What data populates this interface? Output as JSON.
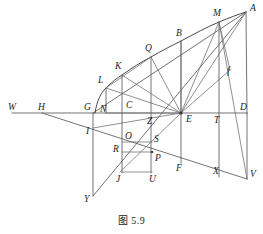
{
  "figure": {
    "caption": "图 5.9",
    "background_color": "#ffffff",
    "line_color": "#5a5a5a",
    "curve_color": "#4a4a4a",
    "label_color": "#1b1b1b",
    "width": 263,
    "height": 234
  },
  "points": [
    {
      "id": "W",
      "label": "W",
      "x": 12,
      "y": 113,
      "label_x": 12,
      "label_y": 108,
      "role": "axis-endpoint-left"
    },
    {
      "id": "H",
      "label": "H",
      "x": 42,
      "y": 113,
      "label_x": 42,
      "label_y": 108,
      "role": "axis-point"
    },
    {
      "id": "G",
      "label": "G",
      "x": 93,
      "y": 113,
      "label_x": 89,
      "label_y": 108,
      "role": "axis-point"
    },
    {
      "id": "N",
      "label": "N",
      "x": 105,
      "y": 113,
      "label_x": 104,
      "label_y": 109,
      "role": "foot-of-L"
    },
    {
      "id": "C",
      "label": "C",
      "x": 131,
      "y": 113,
      "label_x": 129,
      "label_y": 107,
      "role": "axis-point"
    },
    {
      "id": "Z",
      "label": "Z",
      "x": 152,
      "y": 113,
      "label_x": 151,
      "label_y": 121,
      "role": "axis-point"
    },
    {
      "id": "E",
      "label": "E",
      "x": 181,
      "y": 113,
      "label_x": 186,
      "label_y": 120,
      "role": "pencil-vertex"
    },
    {
      "id": "T",
      "label": "T",
      "x": 219,
      "y": 113,
      "label_x": 218,
      "label_y": 120,
      "role": "axis-point"
    },
    {
      "id": "D",
      "label": "D",
      "x": 247,
      "y": 113,
      "label_x": 245,
      "label_y": 108,
      "role": "axis-endpoint-right"
    },
    {
      "id": "A",
      "label": "A",
      "x": 246,
      "y": 12,
      "label_x": 249,
      "label_y": 8,
      "role": "curve-endpoint-top"
    },
    {
      "id": "M",
      "label": "M",
      "x": 219,
      "y": 22,
      "label_x": 216,
      "label_y": 14,
      "role": "curve-point"
    },
    {
      "id": "B",
      "label": "B",
      "x": 181,
      "y": 41,
      "label_x": 179,
      "label_y": 34,
      "role": "curve-point"
    },
    {
      "id": "Q",
      "label": "Q",
      "x": 150,
      "y": 57,
      "label_x": 148,
      "label_y": 49,
      "role": "curve-point"
    },
    {
      "id": "K",
      "label": "K",
      "x": 122,
      "y": 75,
      "label_x": 119,
      "label_y": 67,
      "role": "curve-point"
    },
    {
      "id": "L",
      "label": "L",
      "x": 106,
      "y": 88,
      "label_x": 101,
      "label_y": 81,
      "role": "curve-point"
    },
    {
      "id": "I",
      "label": "I",
      "x": 93,
      "y": 128,
      "label_x": 88,
      "label_y": 131,
      "role": "lower-line-point"
    },
    {
      "id": "O",
      "label": "O",
      "x": 131,
      "y": 142,
      "label_x": 128,
      "label_y": 137,
      "role": "lower-point"
    },
    {
      "id": "S",
      "label": "S",
      "x": 152,
      "y": 142,
      "label_x": 151,
      "label_y": 140,
      "role": "lower-point"
    },
    {
      "id": "R",
      "label": "R",
      "x": 120,
      "y": 152,
      "label_x": 116,
      "label_y": 149,
      "role": "lower-point"
    },
    {
      "id": "P",
      "label": "P",
      "x": 152,
      "y": 155,
      "label_x": 153,
      "label_y": 158,
      "role": "lower-point"
    },
    {
      "id": "J",
      "label": "J",
      "x": 120,
      "y": 172,
      "label_x": 118,
      "label_y": 177,
      "role": "lower-point"
    },
    {
      "id": "U",
      "label": "U",
      "x": 152,
      "y": 172,
      "label_x": 153,
      "label_y": 177,
      "role": "lower-point"
    },
    {
      "id": "F",
      "label": "F",
      "x": 181,
      "y": 163,
      "label_x": 179,
      "label_y": 169,
      "role": "lower-point"
    },
    {
      "id": "X",
      "label": "X",
      "x": 219,
      "y": 177,
      "label_x": 217,
      "label_y": 172,
      "role": "lower-point"
    },
    {
      "id": "V",
      "label": "V",
      "x": 247,
      "y": 179,
      "label_x": 249,
      "label_y": 174,
      "role": "lower-endpoint"
    },
    {
      "id": "Y",
      "label": "Y",
      "x": 93,
      "y": 196,
      "label_x": 88,
      "label_y": 199,
      "role": "lower-endpoint-left"
    },
    {
      "id": "f",
      "label": "f",
      "x": 228,
      "y": 75,
      "label_x": 228,
      "label_y": 74,
      "role": "line-label"
    }
  ],
  "segments": [
    {
      "name": "axis-WD",
      "from": "W",
      "to": "D",
      "style": "main"
    },
    {
      "name": "curve-LA",
      "from": "L",
      "to": "A",
      "style": "curve"
    },
    {
      "name": "chord-GA",
      "from": "G",
      "to": "A",
      "style": "main"
    },
    {
      "name": "vertical-AD",
      "from": "A",
      "to": "D",
      "style": "main"
    },
    {
      "name": "vertical-AV",
      "from": "A",
      "to": "V",
      "style": "main"
    },
    {
      "name": "vertical-MX",
      "from": "M",
      "to": "X",
      "style": "main"
    },
    {
      "name": "vertical-BF",
      "from": "B",
      "to": "F",
      "style": "main"
    },
    {
      "name": "vertical-QZ",
      "from": "Q",
      "to": "S",
      "style": "main"
    },
    {
      "name": "vertical-KC",
      "from": "K",
      "to": "C",
      "style": "main"
    },
    {
      "name": "vertical-LN",
      "from": "L",
      "to": "N",
      "style": "main"
    },
    {
      "name": "vertical-GY",
      "from": "G",
      "to": "Y",
      "style": "main"
    },
    {
      "name": "lower-line-HV",
      "from": "H",
      "to": "V",
      "style": "main"
    },
    {
      "name": "diagonal-YA",
      "from": "Y",
      "to": "A",
      "style": "main"
    },
    {
      "name": "ray-EL",
      "from": "E",
      "to": "L",
      "style": "thin"
    },
    {
      "name": "ray-EK",
      "from": "E",
      "to": "K",
      "style": "thin"
    },
    {
      "name": "ray-EQ",
      "from": "E",
      "to": "Q",
      "style": "thin"
    },
    {
      "name": "ray-EM",
      "from": "E",
      "to": "M",
      "style": "thin"
    },
    {
      "name": "ray-EA",
      "from": "E",
      "to": "A",
      "style": "thin"
    },
    {
      "name": "ray-EJ",
      "from": "E",
      "to": "J",
      "style": "thin"
    },
    {
      "name": "ray-EU",
      "from": "E",
      "to": "U",
      "style": "thin"
    },
    {
      "name": "segment-MV",
      "from": "M",
      "to": "V",
      "style": "thin"
    },
    {
      "name": "segment-QN",
      "from": "Q",
      "to": "N",
      "style": "thin"
    },
    {
      "name": "segment-OS",
      "from": "O",
      "to": "S",
      "style": "thin"
    },
    {
      "name": "segment-RP",
      "from": "R",
      "to": "P",
      "style": "thin"
    },
    {
      "name": "rect-JU",
      "from": "J",
      "to": "U",
      "style": "thin"
    },
    {
      "name": "vertical-JR",
      "from": "J",
      "to": "O",
      "style": "thin"
    }
  ]
}
